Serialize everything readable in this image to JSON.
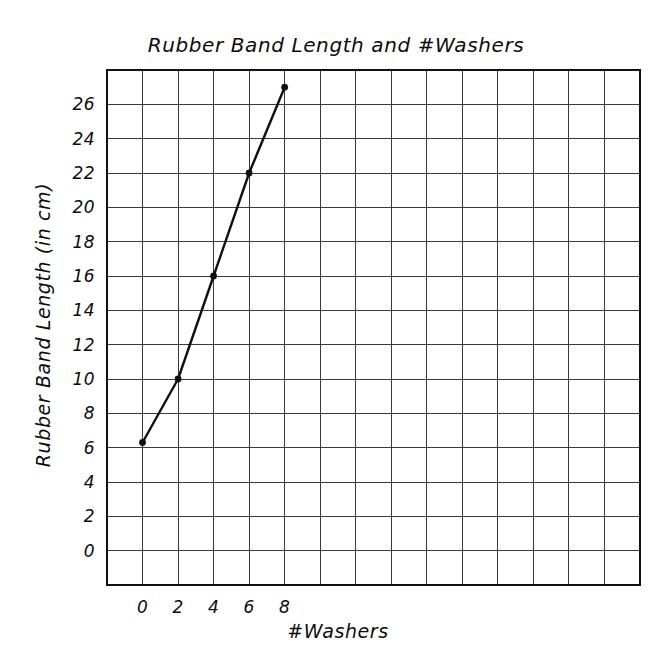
{
  "chart_data": {
    "type": "line",
    "title": "Rubber Band Length and #Washers",
    "xlabel": "#Washers",
    "ylabel": "Rubber Band Length (in cm)",
    "x": [
      0,
      2,
      4,
      6,
      8
    ],
    "values": [
      6.3,
      10,
      16,
      22,
      27
    ],
    "series": [
      {
        "name": "Rubber Band Length",
        "x": [
          0,
          2,
          4,
          6,
          8
        ],
        "values": [
          6.3,
          10,
          16,
          22,
          27
        ]
      }
    ],
    "xticks": [
      "0",
      "2",
      "4",
      "6",
      "8"
    ],
    "xtick_values": [
      0,
      2,
      4,
      6,
      8
    ],
    "yticks": [
      "0",
      "2",
      "4",
      "6",
      "8",
      "10",
      "12",
      "14",
      "16",
      "18",
      "20",
      "22",
      "24",
      "26"
    ],
    "ytick_values": [
      0,
      2,
      4,
      6,
      8,
      10,
      12,
      14,
      16,
      18,
      20,
      22,
      24,
      26
    ],
    "xlim": [
      -2,
      28
    ],
    "ylim": [
      -2,
      28
    ],
    "grid": true,
    "grid_columns": 15,
    "grid_rows": 15,
    "legend": "none",
    "marker": "filled-circle",
    "line_color": "#101010",
    "grid_color": "#3a3a3a",
    "frame_color": "#111111",
    "background_color": "#ffffff"
  },
  "axes": {
    "x_axis_title": "#Washers",
    "y_axis_title": "Rubber Band Length (in cm)"
  },
  "title": {
    "text": "Rubber Band Length and #Washers"
  }
}
